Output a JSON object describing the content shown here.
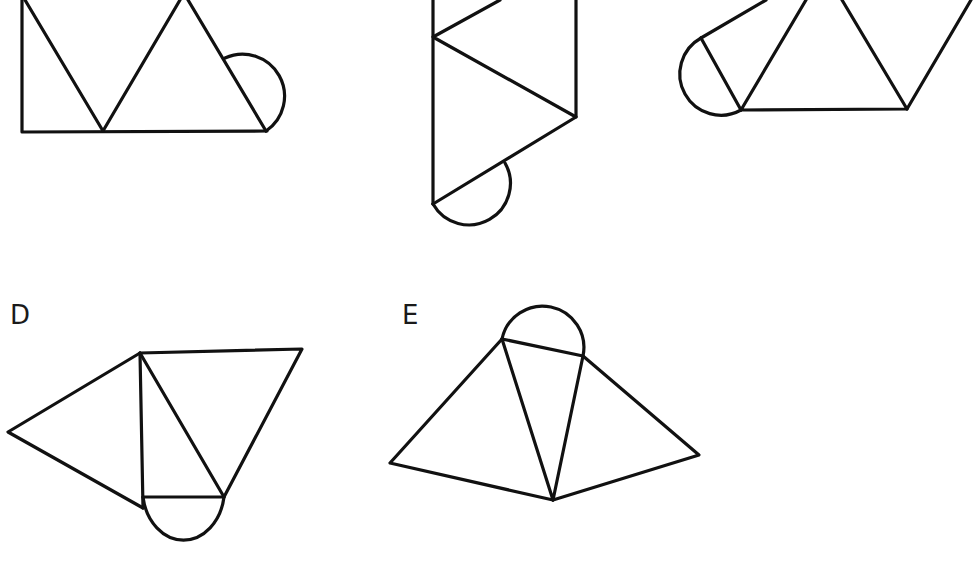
{
  "figures": [
    {
      "id": "A",
      "label": "",
      "description": "Net with rectangle-like strip of triangles and semicircle on right slanted edge (cropped at top)"
    },
    {
      "id": "B",
      "label": "",
      "description": "Vertical strip of triangles with semicircle at bottom-left (cropped at top)"
    },
    {
      "id": "C",
      "label": "",
      "description": "Row of triangles with semicircle at left (cropped at top)"
    },
    {
      "id": "D",
      "label": "D",
      "description": "Net of triangles with semicircle below central triangle"
    },
    {
      "id": "E",
      "label": "E",
      "description": "Fan of three triangles with semicircle on top"
    }
  ],
  "colors": {
    "stroke": "#111111",
    "background": "#ffffff"
  }
}
